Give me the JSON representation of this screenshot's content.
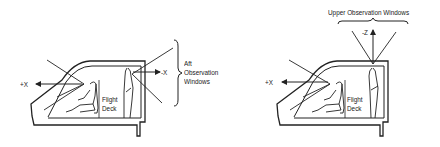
{
  "left_diagram": {
    "axis_plus_x": "+X",
    "axis_minus_x": "-X",
    "flight_deck_line1": "Flight",
    "flight_deck_line2": "Deck",
    "aft_label_line1": "Aft",
    "aft_label_line2": "Observation",
    "aft_label_line3": "Windows"
  },
  "right_diagram": {
    "axis_plus_x": "+X",
    "axis_minus_z": "-Z",
    "flight_deck_line1": "Flight",
    "flight_deck_line2": "Deck",
    "upper_label": "Upper Observation Windows"
  },
  "colors": {
    "ink": "#222222",
    "background": "#ffffff"
  }
}
